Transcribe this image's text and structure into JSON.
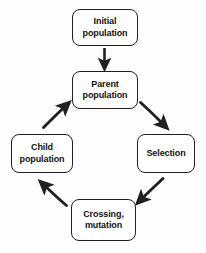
{
  "diagram": {
    "type": "cycle-flowchart",
    "background_color": "#fdfdfd",
    "stroke_color": "#231f20",
    "text_color": "#111111",
    "nodes": [
      {
        "id": "initial",
        "line1": "Initial",
        "line2": "population"
      },
      {
        "id": "parent",
        "line1": "Parent",
        "line2": "population"
      },
      {
        "id": "selection",
        "line1": "Selection",
        "line2": ""
      },
      {
        "id": "crossing",
        "line1": "Crossing,",
        "line2": "mutation"
      },
      {
        "id": "child",
        "line1": "Child",
        "line2": "population"
      }
    ],
    "edges": [
      {
        "id": "initial-to-parent",
        "from": "initial",
        "to": "parent",
        "shape": "straight-down"
      },
      {
        "id": "parent-to-selection",
        "from": "parent",
        "to": "selection",
        "shape": "curve-down-right"
      },
      {
        "id": "selection-to-crossing",
        "from": "selection",
        "to": "crossing",
        "shape": "curve-down-left"
      },
      {
        "id": "crossing-to-child",
        "from": "crossing",
        "to": "child",
        "shape": "curve-up-left"
      },
      {
        "id": "child-to-parent",
        "from": "child",
        "to": "parent",
        "shape": "curve-up-right"
      }
    ]
  }
}
